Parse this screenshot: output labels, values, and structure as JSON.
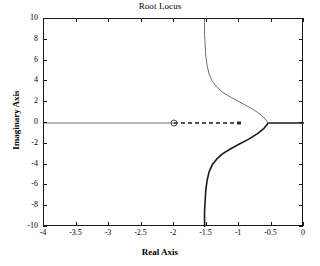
{
  "chart_data": {
    "type": "line",
    "title": "Root Locus",
    "xlabel": "Real Axis",
    "ylabel": "Imaginary Axis",
    "xlim": [
      -4,
      0
    ],
    "ylim": [
      -10,
      10
    ],
    "grid": false,
    "legend": "none",
    "xticks": [
      -4,
      -3.5,
      -3,
      -2.5,
      -2,
      -1.5,
      -1,
      -0.5,
      0
    ],
    "xtick_labels": [
      "-4",
      "-3.5",
      "-3",
      "-2.5",
      "-2",
      "-1.5",
      "-1",
      "-0.5",
      "0"
    ],
    "yticks": [
      -10,
      -8,
      -6,
      -4,
      -2,
      0,
      2,
      4,
      6,
      8,
      10
    ],
    "ytick_labels": [
      "-10",
      "-8",
      "-6",
      "-4",
      "-2",
      "0",
      "2",
      "4",
      "6",
      "8",
      "10"
    ],
    "annotations": {
      "zero_marker": {
        "label": "open-circle-zero",
        "x": -2.0,
        "y": 0.0
      },
      "breakaway_point": {
        "x": -0.55,
        "y": 0.0
      },
      "vertical_asymptote_x": -1.53,
      "dashed_segment": {
        "from_x": -2.0,
        "to_x": -1.0,
        "y": 0.0
      },
      "pole_marker": {
        "label": "pole-tick",
        "x": -1.0,
        "y": 0.0
      }
    },
    "series": [
      {
        "name": "real-axis-locus-left",
        "style": "thin-gray",
        "points": [
          [
            -4.0,
            0.0
          ],
          [
            -2.0,
            0.0
          ]
        ]
      },
      {
        "name": "real-axis-locus-dashed",
        "style": "dashed",
        "points": [
          [
            -2.0,
            0.0
          ],
          [
            -1.0,
            0.0
          ]
        ]
      },
      {
        "name": "real-axis-locus-right",
        "style": "thick-black",
        "points": [
          [
            -0.55,
            0.0
          ],
          [
            0.0,
            0.0
          ]
        ]
      },
      {
        "name": "upper-branch",
        "style": "thin-gray",
        "points": [
          [
            -0.55,
            0.0
          ],
          [
            -0.62,
            0.55
          ],
          [
            -0.72,
            1.05
          ],
          [
            -0.85,
            1.55
          ],
          [
            -1.0,
            2.05
          ],
          [
            -1.12,
            2.45
          ],
          [
            -1.25,
            2.95
          ],
          [
            -1.34,
            3.45
          ],
          [
            -1.41,
            4.0
          ],
          [
            -1.46,
            4.7
          ],
          [
            -1.49,
            5.5
          ],
          [
            -1.51,
            6.4
          ],
          [
            -1.52,
            7.4
          ],
          [
            -1.53,
            8.5
          ],
          [
            -1.53,
            10.0
          ]
        ]
      },
      {
        "name": "lower-branch",
        "style": "thick-black",
        "points": [
          [
            -0.55,
            0.0
          ],
          [
            -0.62,
            -0.55
          ],
          [
            -0.72,
            -1.05
          ],
          [
            -0.85,
            -1.55
          ],
          [
            -1.0,
            -2.05
          ],
          [
            -1.12,
            -2.45
          ],
          [
            -1.25,
            -2.95
          ],
          [
            -1.34,
            -3.45
          ],
          [
            -1.41,
            -4.0
          ],
          [
            -1.46,
            -4.7
          ],
          [
            -1.49,
            -5.5
          ],
          [
            -1.51,
            -6.4
          ],
          [
            -1.52,
            -7.4
          ],
          [
            -1.53,
            -8.5
          ],
          [
            -1.53,
            -10.0
          ]
        ]
      }
    ]
  }
}
